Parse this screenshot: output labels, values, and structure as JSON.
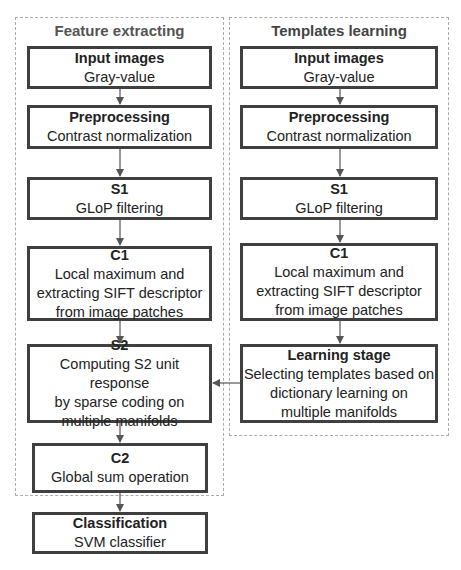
{
  "groups": {
    "feature": {
      "title": "Feature extracting"
    },
    "templates": {
      "title": "Templates learning"
    }
  },
  "left": {
    "input": {
      "title": "Input images",
      "desc": "Gray-value"
    },
    "pre": {
      "title": "Preprocessing",
      "desc": "Contrast normalization"
    },
    "s1": {
      "title": "S1",
      "desc": "GLoP filtering"
    },
    "c1": {
      "title": "C1",
      "l1": "Local maximum and",
      "l2": "extracting SIFT descriptor",
      "l3": "from image patches"
    },
    "s2": {
      "title": "S2",
      "l1": "Computing S2 unit response",
      "l2": "by sparse coding on",
      "l3": "multiple manifolds"
    },
    "c2": {
      "title": "C2",
      "desc": "Global sum operation"
    }
  },
  "right": {
    "input": {
      "title": "Input images",
      "desc": "Gray-value"
    },
    "pre": {
      "title": "Preprocessing",
      "desc": "Contrast normalization"
    },
    "s1": {
      "title": "S1",
      "desc": "GLoP filtering"
    },
    "c1": {
      "title": "C1",
      "l1": "Local maximum and",
      "l2": "extracting SIFT descriptor",
      "l3": "from image patches"
    },
    "learn": {
      "title": "Learning stage",
      "l1": "Selecting templates based on",
      "l2": "dictionary learning on",
      "l3": "multiple manifolds"
    }
  },
  "classification": {
    "title": "Classification",
    "desc": "SVM classifier"
  }
}
